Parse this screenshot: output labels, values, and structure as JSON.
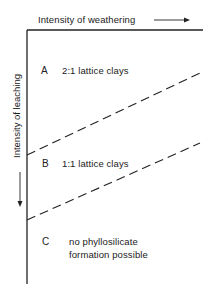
{
  "axes": {
    "x_label": "Intensity of weathering",
    "y_label": "Intensity of leaching"
  },
  "zones": [
    {
      "letter": "A",
      "text": "2:1  lattice clays"
    },
    {
      "letter": "B",
      "text": "1:1  lattice clays"
    },
    {
      "letter": "C",
      "text_line1": "no  phyllosilicate",
      "text_line2": "formation  possible"
    }
  ],
  "boundaries": [
    {
      "name": "A-B boundary",
      "style": "dashed"
    },
    {
      "name": "B-C boundary",
      "style": "dashed"
    }
  ],
  "colors": {
    "line": "#222222",
    "background": "#ffffff"
  }
}
